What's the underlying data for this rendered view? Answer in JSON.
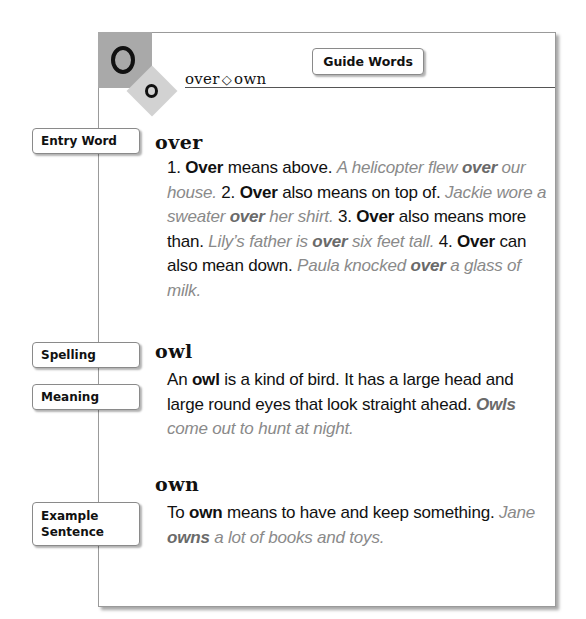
{
  "header": {
    "letter_big": "O",
    "letter_small": "o",
    "guide_word_first": "over",
    "guide_word_separator": "◇",
    "guide_word_last": "own",
    "guide_label": "Guide Words"
  },
  "labels": {
    "entry_word": "Entry Word",
    "spelling": "Spelling",
    "meaning": "Meaning",
    "example_line1": "Example",
    "example_line2": "Sentence"
  },
  "entries": [
    {
      "word": "over",
      "parts": [
        {
          "t": "text",
          "v": "1. "
        },
        {
          "t": "bold",
          "v": "Over"
        },
        {
          "t": "text",
          "v": " means above. "
        },
        {
          "t": "ex",
          "v": "A helicopter flew "
        },
        {
          "t": "exbold",
          "v": "over"
        },
        {
          "t": "ex",
          "v": " our house."
        },
        {
          "t": "text",
          "v": " 2. "
        },
        {
          "t": "bold",
          "v": "Over"
        },
        {
          "t": "text",
          "v": " also means on top of. "
        },
        {
          "t": "ex",
          "v": "Jackie wore a sweater "
        },
        {
          "t": "exbold",
          "v": "over"
        },
        {
          "t": "ex",
          "v": " her shirt."
        },
        {
          "t": "text",
          "v": " 3. "
        },
        {
          "t": "bold",
          "v": "Over"
        },
        {
          "t": "text",
          "v": " also means more than. "
        },
        {
          "t": "ex",
          "v": "Lily’s father is "
        },
        {
          "t": "exbold",
          "v": "over"
        },
        {
          "t": "ex",
          "v": " six feet tall."
        },
        {
          "t": "text",
          "v": " 4. "
        },
        {
          "t": "bold",
          "v": "Over"
        },
        {
          "t": "text",
          "v": " can also mean down. "
        },
        {
          "t": "ex",
          "v": "Paula knocked "
        },
        {
          "t": "exbold",
          "v": "over"
        },
        {
          "t": "ex",
          "v": " a glass of milk."
        }
      ]
    },
    {
      "word": "owl",
      "parts": [
        {
          "t": "text",
          "v": "An "
        },
        {
          "t": "bold",
          "v": "owl"
        },
        {
          "t": "text",
          "v": " is a kind of bird. It has a large head and large round eyes that look straight ahead. "
        },
        {
          "t": "exbold",
          "v": "Owls"
        },
        {
          "t": "ex",
          "v": " come out to hunt at night."
        }
      ]
    },
    {
      "word": "own",
      "parts": [
        {
          "t": "text",
          "v": "To "
        },
        {
          "t": "bold",
          "v": "own"
        },
        {
          "t": "text",
          "v": " means to have and keep something. "
        },
        {
          "t": "ex",
          "v": "Jane "
        },
        {
          "t": "exbold",
          "v": "owns"
        },
        {
          "t": "ex",
          "v": " a lot of books and toys."
        }
      ]
    }
  ],
  "colors": {
    "letter_square": "#a9a9a9",
    "letter_diamond": "#d2d2d2",
    "example_text": "#8a8a8a",
    "text": "#111111"
  }
}
